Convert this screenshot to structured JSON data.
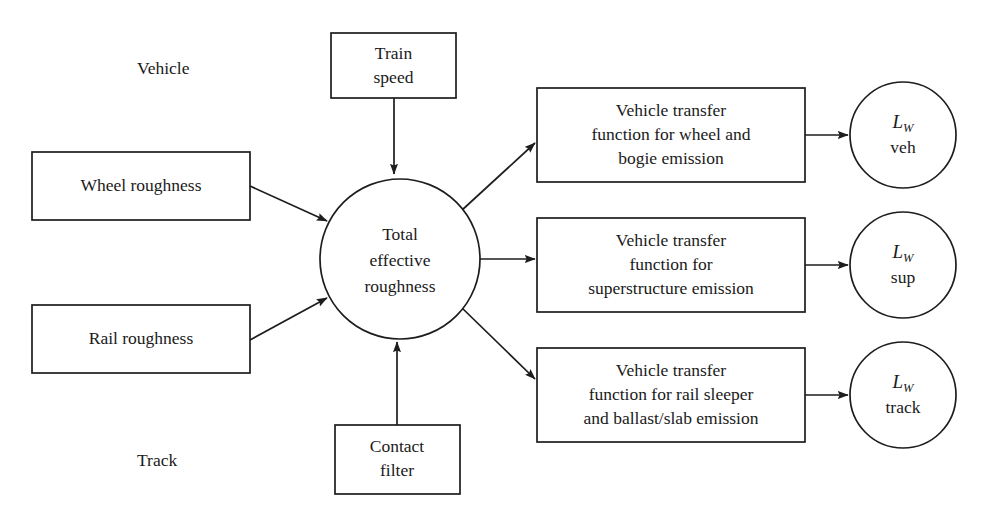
{
  "diagram": {
    "background_color": "#ffffff",
    "stroke_color": "#1d1d1d",
    "text_color": "#1a1a1a",
    "section_labels": [
      {
        "id": "vehicle",
        "text": "Vehicle"
      },
      {
        "id": "track",
        "text": "Track"
      }
    ],
    "input_boxes": [
      {
        "id": "train-speed",
        "lines": [
          "Train",
          "speed"
        ]
      },
      {
        "id": "wheel-roughness",
        "lines": [
          "Wheel roughness"
        ]
      },
      {
        "id": "rail-roughness",
        "lines": [
          "Rail roughness"
        ]
      },
      {
        "id": "contact-filter",
        "lines": [
          "Contact",
          "filter"
        ]
      }
    ],
    "central_node": {
      "id": "total-effective-roughness",
      "lines": [
        "Total",
        "effective",
        "roughness"
      ]
    },
    "transfer_boxes": [
      {
        "id": "vehicle-transfer-wheel-bogie",
        "lines": [
          "Vehicle transfer",
          "function for wheel and",
          "bogie emission"
        ]
      },
      {
        "id": "vehicle-transfer-superstructure",
        "lines": [
          "Vehicle transfer",
          "function for",
          "superstructure emission"
        ]
      },
      {
        "id": "vehicle-transfer-rail-sleeper",
        "lines": [
          "Vehicle transfer",
          "function for rail sleeper",
          "and ballast/slab emission"
        ]
      }
    ],
    "output_circles": [
      {
        "id": "lw-veh",
        "symbol": "L",
        "subscript": "W",
        "qualifier": "veh"
      },
      {
        "id": "lw-sup",
        "symbol": "L",
        "subscript": "W",
        "qualifier": "sup"
      },
      {
        "id": "lw-track",
        "symbol": "L",
        "subscript": "W",
        "qualifier": "track"
      }
    ],
    "edges": [
      {
        "id": "edge-train-speed-to-roughness",
        "from": "train-speed",
        "to": "total-effective-roughness"
      },
      {
        "id": "edge-wheel-roughness-to-roughness",
        "from": "wheel-roughness",
        "to": "total-effective-roughness"
      },
      {
        "id": "edge-rail-roughness-to-roughness",
        "from": "rail-roughness",
        "to": "total-effective-roughness"
      },
      {
        "id": "edge-contact-filter-to-roughness",
        "from": "contact-filter",
        "to": "total-effective-roughness"
      },
      {
        "id": "edge-roughness-to-wheel-bogie",
        "from": "total-effective-roughness",
        "to": "vehicle-transfer-wheel-bogie"
      },
      {
        "id": "edge-roughness-to-superstructure",
        "from": "total-effective-roughness",
        "to": "vehicle-transfer-superstructure"
      },
      {
        "id": "edge-roughness-to-rail-sleeper",
        "from": "total-effective-roughness",
        "to": "vehicle-transfer-rail-sleeper"
      },
      {
        "id": "edge-wheel-bogie-to-lw-veh",
        "from": "vehicle-transfer-wheel-bogie",
        "to": "lw-veh"
      },
      {
        "id": "edge-superstructure-to-lw-sup",
        "from": "vehicle-transfer-superstructure",
        "to": "lw-sup"
      },
      {
        "id": "edge-rail-sleeper-to-lw-track",
        "from": "vehicle-transfer-rail-sleeper",
        "to": "lw-track"
      }
    ]
  }
}
